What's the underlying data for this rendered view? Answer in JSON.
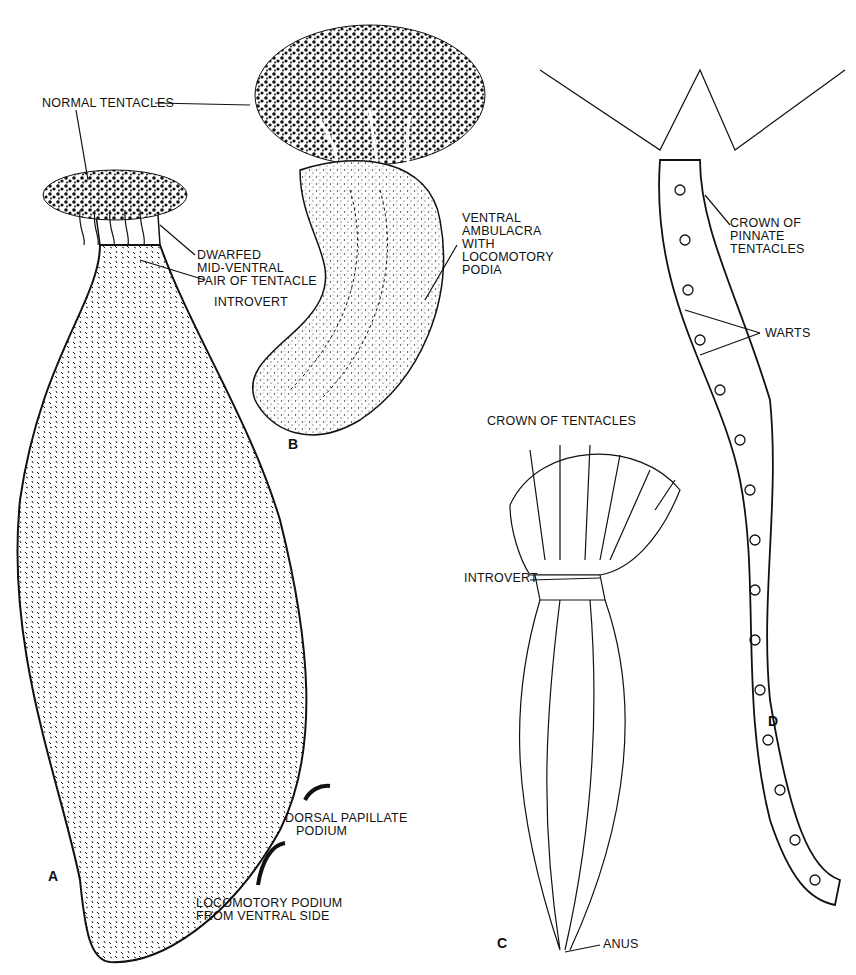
{
  "figure": {
    "panels": [
      {
        "id": "A",
        "letter": "A"
      },
      {
        "id": "B",
        "letter": "B"
      },
      {
        "id": "C",
        "letter": "C"
      },
      {
        "id": "D",
        "letter": "D"
      }
    ],
    "labels": {
      "normal_tentacles": "NORMAL TENTACLES",
      "dwarfed": "DWARFED\nMID-VENTRAL\nPAIR OF TENTACLE",
      "introvert_a": "INTROVERT",
      "ventral_ambulacra": "VENTRAL\nAMBULACRA\nWITH\nLOCOMOTORY\nPODIA",
      "crown_pinnate": "CROWN OF\nPINNATE\nTENTACLES",
      "warts": "WARTS",
      "crown_tentacles": "CROWN OF TENTACLES",
      "introvert_c": "INTROVERT",
      "dorsal_papillate": "DORSAL PAPILLATE\n   PODIUM",
      "locomotory_podium": "LOCOMOTORY PODIUM\nFROM VENTRAL SIDE",
      "anus": "ANUS"
    },
    "colors": {
      "ink": "#111111",
      "paper": "#ffffff",
      "stipple": "#333333"
    }
  }
}
